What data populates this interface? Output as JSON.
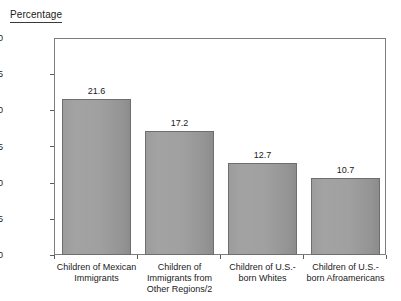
{
  "chart_data": {
    "type": "bar",
    "title": "Percentage",
    "xlabel": "",
    "ylabel": "",
    "ylim": [
      0,
      30
    ],
    "yticks": [
      0,
      5,
      10,
      15,
      20,
      25,
      30
    ],
    "grid": false,
    "legend": "none",
    "categories": [
      "Children of Mexican Immigrants",
      "Children of Immigrants from Other Regions/2",
      "Children of U.S.-born Whites",
      "Children of U.S.-born Afroamericans"
    ],
    "category_lines": [
      [
        "Children of Mexican",
        "Immigrants"
      ],
      [
        "Children of",
        "Immigrants from",
        "Other Regions/2"
      ],
      [
        "Children of U.S.-",
        "born Whites"
      ],
      [
        "Children of U.S.-",
        "born Afroamericans"
      ]
    ],
    "values": [
      21.6,
      17.2,
      12.7,
      10.7
    ],
    "value_labels": [
      "21.6",
      "17.2",
      "12.7",
      "10.7"
    ],
    "bar_color": "#9e9e9e",
    "bar_border_color": "#6e6e6e",
    "axis_color": "#7d7d7d"
  }
}
